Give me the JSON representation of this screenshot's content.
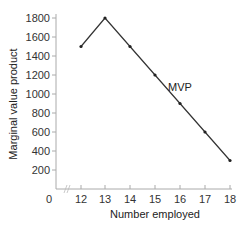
{
  "chart_data": {
    "type": "line",
    "title": "",
    "xlabel": "Number employed",
    "ylabel": "Marginal value product",
    "x": [
      12,
      13,
      14,
      15,
      16,
      17,
      18
    ],
    "series": [
      {
        "name": "MVP",
        "values": [
          1500,
          1800,
          1500,
          1200,
          900,
          600,
          300
        ]
      }
    ],
    "x_ticks": [
      "0",
      "12",
      "13",
      "14",
      "15",
      "16",
      "17",
      "18"
    ],
    "y_ticks": [
      200,
      400,
      600,
      800,
      1000,
      1200,
      1400,
      1600,
      1800
    ],
    "ylim": [
      0,
      1800
    ],
    "xlim": [
      11,
      18
    ],
    "axis_break": "x-axis break between 0 and 12",
    "grid": false,
    "legend": "none (inline label 'MVP' on line)",
    "annotations": [
      {
        "text": "MVP",
        "x": 16,
        "y": 1050
      }
    ]
  },
  "colors": {
    "line": "#333333",
    "axis": "#aaaaaa",
    "text": "#333333"
  }
}
